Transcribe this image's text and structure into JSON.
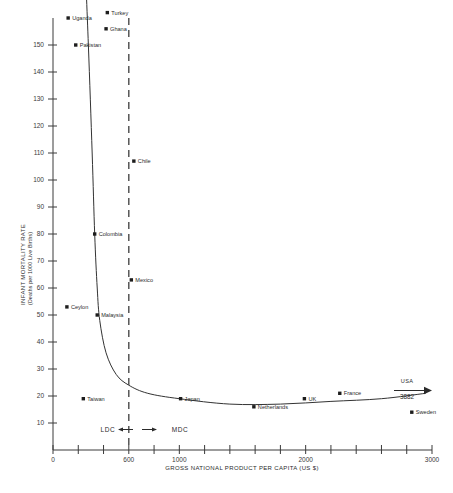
{
  "chart_data": {
    "type": "scatter",
    "title": "",
    "xlabel": "GROSS NATIONAL PRODUCT PER CAPITA (US $)",
    "ylabel": "INFANT MORTALITY RATE",
    "ylabel_sub": "(Deaths per 1000 Live Births)",
    "xlim": [
      0,
      3000
    ],
    "ylim": [
      0,
      160
    ],
    "grid": false,
    "legend": "none",
    "xticks": [
      {
        "value": 0,
        "label": "0"
      },
      {
        "value": 200,
        "label": ""
      },
      {
        "value": 400,
        "label": ""
      },
      {
        "value": 600,
        "label": "600"
      },
      {
        "value": 800,
        "label": ""
      },
      {
        "value": 1000,
        "label": "1000"
      },
      {
        "value": 1200,
        "label": ""
      },
      {
        "value": 1400,
        "label": ""
      },
      {
        "value": 1600,
        "label": ""
      },
      {
        "value": 1800,
        "label": ""
      },
      {
        "value": 2000,
        "label": "2000"
      },
      {
        "value": 2200,
        "label": ""
      },
      {
        "value": 2400,
        "label": ""
      },
      {
        "value": 2600,
        "label": ""
      },
      {
        "value": 2800,
        "label": ""
      },
      {
        "value": 3000,
        "label": "3000"
      }
    ],
    "yticks": [
      {
        "value": 10,
        "label": "10"
      },
      {
        "value": 20,
        "label": "20"
      },
      {
        "value": 30,
        "label": "30"
      },
      {
        "value": 40,
        "label": "40"
      },
      {
        "value": 50,
        "label": "50"
      },
      {
        "value": 60,
        "label": "60"
      },
      {
        "value": 70,
        "label": "70"
      },
      {
        "value": 80,
        "label": "80"
      },
      {
        "value": 90,
        "label": "90"
      },
      {
        "value": 100,
        "label": "100"
      },
      {
        "value": 110,
        "label": "110"
      },
      {
        "value": 120,
        "label": "120"
      },
      {
        "value": 130,
        "label": "130"
      },
      {
        "value": 140,
        "label": "140"
      },
      {
        "value": 150,
        "label": "150"
      }
    ],
    "points": [
      {
        "name": "Uganda",
        "x": 120,
        "y": 160,
        "label_side": "right"
      },
      {
        "name": "Turkey",
        "x": 430,
        "y": 162,
        "label_side": "right"
      },
      {
        "name": "Ghana",
        "x": 420,
        "y": 156,
        "label_side": "right"
      },
      {
        "name": "Pakistan",
        "x": 180,
        "y": 150,
        "label_side": "right"
      },
      {
        "name": "Chile",
        "x": 640,
        "y": 107,
        "label_side": "right"
      },
      {
        "name": "Colombia",
        "x": 330,
        "y": 80,
        "label_side": "right"
      },
      {
        "name": "Mexico",
        "x": 620,
        "y": 63,
        "label_side": "right"
      },
      {
        "name": "Ceylon",
        "x": 110,
        "y": 53,
        "label_side": "right"
      },
      {
        "name": "Malaysia",
        "x": 350,
        "y": 50,
        "label_side": "right"
      },
      {
        "name": "Taiwan",
        "x": 240,
        "y": 19,
        "label_side": "right"
      },
      {
        "name": "Japan",
        "x": 1010,
        "y": 19,
        "label_side": "right"
      },
      {
        "name": "Netherlands",
        "x": 1590,
        "y": 16,
        "label_side": "right"
      },
      {
        "name": "UK",
        "x": 1990,
        "y": 19,
        "label_side": "right"
      },
      {
        "name": "France",
        "x": 2270,
        "y": 21,
        "label_side": "right"
      },
      {
        "name": "Sweden",
        "x": 2840,
        "y": 14,
        "label_side": "right"
      }
    ],
    "trend_curve": {
      "description": "fitted hyperbolic decline of infant mortality against GNP per capita",
      "points": [
        {
          "x": 250,
          "y": 185
        },
        {
          "x": 280,
          "y": 150
        },
        {
          "x": 310,
          "y": 110
        },
        {
          "x": 330,
          "y": 80
        },
        {
          "x": 350,
          "y": 60
        },
        {
          "x": 370,
          "y": 48
        },
        {
          "x": 420,
          "y": 36
        },
        {
          "x": 500,
          "y": 28
        },
        {
          "x": 600,
          "y": 24
        },
        {
          "x": 750,
          "y": 21
        },
        {
          "x": 1000,
          "y": 19
        },
        {
          "x": 1400,
          "y": 17
        },
        {
          "x": 1800,
          "y": 17
        },
        {
          "x": 2200,
          "y": 18
        },
        {
          "x": 2600,
          "y": 19
        },
        {
          "x": 2950,
          "y": 21
        }
      ]
    },
    "annotations": {
      "divider_x": 600,
      "divider_label_left": "LDC",
      "divider_label_right": "MDC",
      "offscale_marker": {
        "name": "USA",
        "value_label": "3882",
        "x_anchor": 2900,
        "y_anchor": 24
      }
    }
  }
}
